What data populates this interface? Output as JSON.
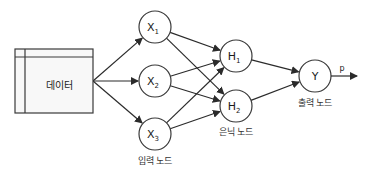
{
  "data_box": {
    "label": "데이터"
  },
  "input_nodes": [
    {
      "id": "x1",
      "label": "X",
      "sub": "1"
    },
    {
      "id": "x2",
      "label": "X",
      "sub": "2"
    },
    {
      "id": "x3",
      "label": "X",
      "sub": "3"
    }
  ],
  "hidden_nodes": [
    {
      "id": "h1",
      "label": "H",
      "sub": "1"
    },
    {
      "id": "h2",
      "label": "H",
      "sub": "2"
    }
  ],
  "output_node": {
    "id": "y",
    "label": "Y"
  },
  "output_arrow_label": "p",
  "captions": {
    "input": "입력 노드",
    "hidden": "은닉 노드",
    "output": "출력 노드"
  },
  "edges": [
    [
      "data",
      "x1"
    ],
    [
      "data",
      "x2"
    ],
    [
      "data",
      "x3"
    ],
    [
      "x1",
      "h1"
    ],
    [
      "x1",
      "h2"
    ],
    [
      "x2",
      "h1"
    ],
    [
      "x2",
      "h2"
    ],
    [
      "x3",
      "h1"
    ],
    [
      "x3",
      "h2"
    ],
    [
      "h1",
      "y"
    ],
    [
      "h2",
      "y"
    ]
  ]
}
